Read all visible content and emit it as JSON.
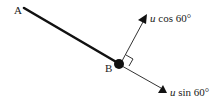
{
  "diagram": {
    "points": {
      "A": {
        "label": "A"
      },
      "B": {
        "label": "B"
      }
    },
    "vectors": [
      {
        "name": "u-cos-60",
        "var": "u",
        "rest": " cos 60°"
      },
      {
        "name": "u-sin-60",
        "var": "u",
        "rest": " sin 60°"
      }
    ],
    "colors": {
      "stroke": "#111111",
      "text": "#222222"
    }
  }
}
